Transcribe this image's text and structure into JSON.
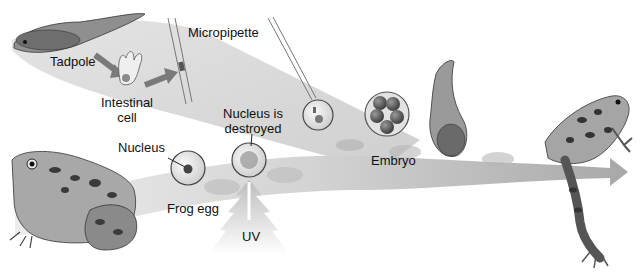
{
  "diagram": {
    "labels": {
      "tadpole": "Tadpole",
      "intestinal_cell_line1": "Intestinal",
      "intestinal_cell_line2": "cell",
      "micropipette": "Micropipette",
      "nucleus": "Nucleus",
      "nucleus_destroyed_line1": "Nucleus is",
      "nucleus_destroyed_line2": "destroyed",
      "frog_egg": "Frog egg",
      "uv": "UV",
      "embryo": "Embryo"
    },
    "stages": [
      {
        "id": "donor-tadpole",
        "name": "Tadpole"
      },
      {
        "id": "intestinal-cell",
        "name": "Intestinal cell"
      },
      {
        "id": "micropipette-extraction",
        "name": "Micropipette"
      },
      {
        "id": "donor-frog",
        "name": "Frog"
      },
      {
        "id": "frog-egg",
        "name": "Frog egg"
      },
      {
        "id": "uv-irradiation",
        "name": "UV"
      },
      {
        "id": "enucleated-egg",
        "name": "Nucleus is destroyed"
      },
      {
        "id": "nuclear-injection",
        "name": "Micropipette injection"
      },
      {
        "id": "embryo",
        "name": "Embryo"
      },
      {
        "id": "cloned-tadpole",
        "name": "Tadpole"
      },
      {
        "id": "cloned-frog",
        "name": "Frog"
      }
    ],
    "colors": {
      "band": "#d6d6d6",
      "band_dark": "#bdbdbd",
      "ink": "#1a1a1a",
      "arrow": "#8a8a8a"
    }
  }
}
